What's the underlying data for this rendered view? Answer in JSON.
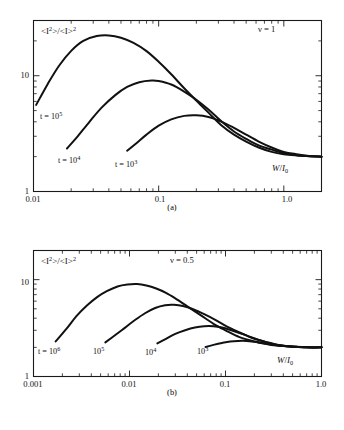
{
  "figure": {
    "background": "#ffffff",
    "line_color": "#111111",
    "panels": [
      {
        "id": "a",
        "caption": "(a)",
        "annotation": "ν = 1",
        "ylabel": "<I²>/<I>²",
        "ylabel_parts": {
          "base1": "<I",
          "sup1": "2",
          "mid": ">/<I>",
          "sup2": "2"
        },
        "xlabel": "W/I₀",
        "xlabel_parts": {
          "num": "W",
          "den": "I",
          "den_sub": "0"
        },
        "xticks": [
          "0.01",
          "0.1",
          "1.0"
        ],
        "yticks": [
          "1",
          "10"
        ],
        "curve_labels": [
          {
            "text": "t = 10⁵",
            "base": "t = 10",
            "sup": "5"
          },
          {
            "text": "t = 10⁴",
            "base": "t = 10",
            "sup": "4"
          },
          {
            "text": "t = 10³",
            "base": "t = 10",
            "sup": "3"
          }
        ]
      },
      {
        "id": "b",
        "caption": "(b)",
        "annotation": "ν = 0.5",
        "ylabel": "<I²>/<I>²",
        "ylabel_parts": {
          "base1": "<I",
          "sup1": "2",
          "mid": ">/<I>",
          "sup2": "2"
        },
        "xlabel": "W/I₀",
        "xlabel_parts": {
          "num": "W",
          "den": "I",
          "den_sub": "0"
        },
        "xticks": [
          "0.001",
          "0.01",
          "0.1",
          "1.0"
        ],
        "yticks": [
          "1",
          "10"
        ],
        "curve_labels": [
          {
            "text": "t = 10⁶",
            "base": "t = 10",
            "sup": "6"
          },
          {
            "text": "10⁵",
            "base": "10",
            "sup": "5"
          },
          {
            "text": "10⁴",
            "base": "10",
            "sup": "4"
          },
          {
            "text": "10³",
            "base": "10",
            "sup": "3"
          }
        ]
      }
    ]
  },
  "chart_data": [
    {
      "type": "line",
      "panel": "a",
      "title": "(a)",
      "xlabel": "W/I0",
      "ylabel": "<I^2>/<I>^2",
      "xscale": "log",
      "yscale": "log",
      "xlim": [
        0.01,
        2.0
      ],
      "ylim": [
        1.0,
        30.0
      ],
      "xticks": [
        0.01,
        0.1,
        1.0
      ],
      "yticks": [
        1,
        10
      ],
      "grid": false,
      "legend": "inline-labels",
      "annotations": [
        "ν = 1"
      ],
      "asymptote": 2.0,
      "series": [
        {
          "name": "t = 10^5",
          "x": [
            0.0105,
            0.013,
            0.016,
            0.02,
            0.025,
            0.032,
            0.04,
            0.05,
            0.063,
            0.08,
            0.1,
            0.126,
            0.16,
            0.2,
            0.25,
            0.32,
            0.4,
            0.5,
            0.63,
            0.8,
            1.0,
            1.26,
            1.6,
            2.0
          ],
          "y": [
            5.6,
            8.5,
            12.2,
            16.4,
            20.0,
            22.0,
            22.3,
            21.3,
            19.2,
            16.3,
            13.2,
            10.3,
            7.8,
            6.1,
            4.8,
            3.7,
            3.1,
            2.7,
            2.4,
            2.2,
            2.1,
            2.05,
            2.02,
            2.0
          ]
        },
        {
          "name": "t = 10^4",
          "x": [
            0.0185,
            0.022,
            0.028,
            0.035,
            0.045,
            0.056,
            0.07,
            0.088,
            0.1,
            0.126,
            0.16,
            0.2,
            0.25,
            0.32,
            0.4,
            0.5,
            0.63,
            0.8,
            1.0,
            1.26,
            1.6,
            2.0
          ],
          "y": [
            2.35,
            2.9,
            4.0,
            5.3,
            6.8,
            8.0,
            8.8,
            9.1,
            9.0,
            8.4,
            7.3,
            6.2,
            5.1,
            4.0,
            3.3,
            2.85,
            2.5,
            2.3,
            2.15,
            2.07,
            2.02,
            2.0
          ]
        },
        {
          "name": "t = 10^3",
          "x": [
            0.056,
            0.066,
            0.08,
            0.1,
            0.126,
            0.16,
            0.2,
            0.25,
            0.32,
            0.4,
            0.5,
            0.63,
            0.8,
            1.0,
            1.26,
            1.6,
            2.0
          ],
          "y": [
            2.25,
            2.6,
            3.1,
            3.7,
            4.2,
            4.5,
            4.55,
            4.4,
            4.0,
            3.55,
            3.1,
            2.7,
            2.4,
            2.2,
            2.1,
            2.03,
            2.0
          ]
        }
      ]
    },
    {
      "type": "line",
      "panel": "b",
      "title": "(b)",
      "xlabel": "W/I0",
      "ylabel": "<I^2>/<I>^2",
      "xscale": "log",
      "yscale": "log",
      "xlim": [
        0.001,
        1.0
      ],
      "ylim": [
        1.0,
        20.0
      ],
      "xticks": [
        0.001,
        0.01,
        0.1,
        1.0
      ],
      "yticks": [
        1,
        10
      ],
      "grid": false,
      "legend": "inline-labels",
      "annotations": [
        "ν = 0.5"
      ],
      "asymptote": 2.0,
      "series": [
        {
          "name": "t = 10^6",
          "x": [
            0.0017,
            0.0022,
            0.0028,
            0.0036,
            0.0046,
            0.0058,
            0.0075,
            0.0095,
            0.012,
            0.015,
            0.019,
            0.024,
            0.03,
            0.04,
            0.055,
            0.075,
            0.1,
            0.14,
            0.2,
            0.3,
            0.45,
            0.7,
            1.0
          ],
          "y": [
            2.3,
            3.1,
            4.2,
            5.4,
            6.6,
            7.6,
            8.5,
            8.9,
            9.0,
            8.7,
            8.1,
            7.3,
            6.4,
            5.3,
            4.3,
            3.5,
            3.0,
            2.55,
            2.3,
            2.12,
            2.05,
            2.0,
            2.0
          ]
        },
        {
          "name": "t = 10^5",
          "x": [
            0.0056,
            0.007,
            0.009,
            0.0115,
            0.0145,
            0.0185,
            0.0235,
            0.029,
            0.036,
            0.046,
            0.06,
            0.08,
            0.105,
            0.14,
            0.19,
            0.26,
            0.35,
            0.48,
            0.7,
            1.0
          ],
          "y": [
            2.25,
            2.65,
            3.2,
            3.85,
            4.5,
            5.1,
            5.45,
            5.5,
            5.35,
            4.95,
            4.4,
            3.8,
            3.25,
            2.85,
            2.5,
            2.28,
            2.12,
            2.04,
            2.0,
            2.0
          ]
        },
        {
          "name": "t = 10^4",
          "x": [
            0.0195,
            0.024,
            0.03,
            0.038,
            0.048,
            0.06,
            0.075,
            0.092,
            0.115,
            0.145,
            0.185,
            0.24,
            0.31,
            0.42,
            0.58,
            0.8,
            1.0
          ],
          "y": [
            2.2,
            2.45,
            2.75,
            3.0,
            3.2,
            3.3,
            3.3,
            3.2,
            3.0,
            2.78,
            2.55,
            2.33,
            2.17,
            2.07,
            2.02,
            2.0,
            2.0
          ]
        },
        {
          "name": "t = 10^3",
          "x": [
            0.062,
            0.075,
            0.092,
            0.112,
            0.135,
            0.165,
            0.2,
            0.25,
            0.31,
            0.4,
            0.52,
            0.7,
            1.0
          ],
          "y": [
            2.02,
            2.12,
            2.22,
            2.3,
            2.33,
            2.33,
            2.28,
            2.2,
            2.13,
            2.07,
            2.03,
            2.0,
            2.0
          ]
        }
      ]
    }
  ]
}
